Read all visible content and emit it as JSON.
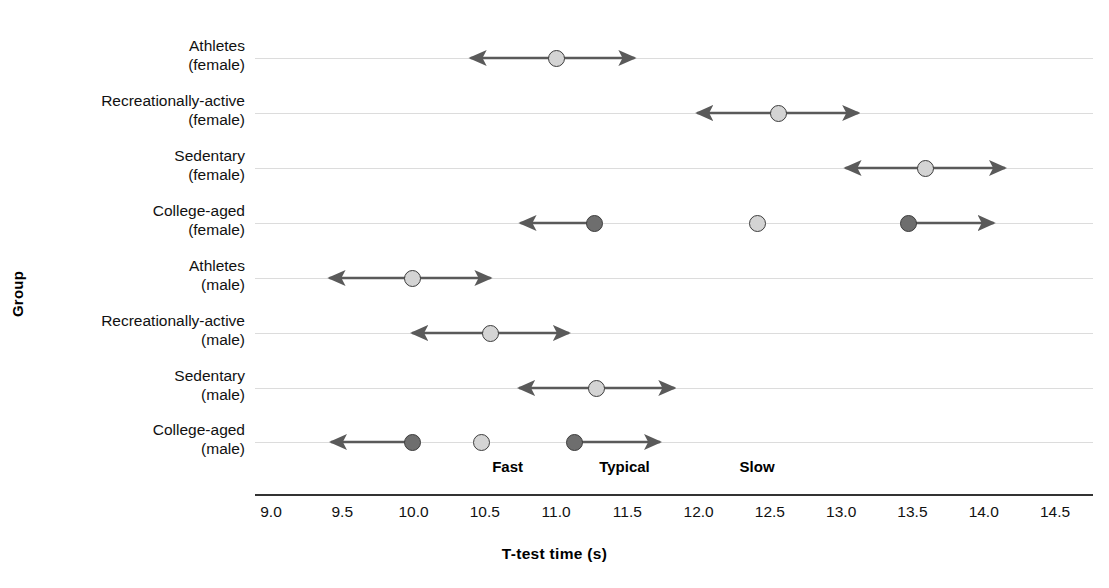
{
  "chart_data": {
    "type": "scatter",
    "title": "",
    "xlabel": "T-test time (s)",
    "ylabel": "Group",
    "xlim": [
      9.0,
      14.5
    ],
    "xticks": [
      "9.0",
      "9.5",
      "10.0",
      "10.5",
      "11.0",
      "11.5",
      "12.0",
      "12.5",
      "13.0",
      "13.5",
      "14.0",
      "14.5"
    ],
    "xtick_values": [
      9.0,
      9.5,
      10.0,
      10.5,
      11.0,
      11.5,
      12.0,
      12.5,
      13.0,
      13.5,
      14.0,
      14.5
    ],
    "grid": "horizontal",
    "legend": "none",
    "categories": [
      {
        "line1": "Athletes",
        "line2": "(female)"
      },
      {
        "line1": "Recreationally-active",
        "line2": "(female)"
      },
      {
        "line1": "Sedentary",
        "line2": "(female)"
      },
      {
        "line1": "College-aged",
        "line2": "(female)"
      },
      {
        "line1": "Athletes",
        "line2": "(male)"
      },
      {
        "line1": "Recreationally-active",
        "line2": "(male)"
      },
      {
        "line1": "Sedentary",
        "line2": "(male)"
      },
      {
        "line1": "College-aged",
        "line2": "(male)"
      }
    ],
    "annotations": [
      {
        "label": "Fast",
        "x": 10.66
      },
      {
        "label": "Typical",
        "x": 11.48
      },
      {
        "label": "Slow",
        "x": 12.41
      }
    ],
    "colors": {
      "marker_light": "#d4d4d4",
      "marker_dark": "#6e6e6e",
      "marker_edge": "#3d3d3d",
      "whisker": "#5a5a5a",
      "grid": "#dcdcdc",
      "axis": "#333333"
    },
    "rows": [
      {
        "group": "Athletes (female)",
        "points": [
          {
            "x": 11.0,
            "shade": "light",
            "left_arrow": 10.4,
            "right_arrow": 11.55
          }
        ]
      },
      {
        "group": "Recreationally-active (female)",
        "points": [
          {
            "x": 12.56,
            "shade": "light",
            "left_arrow": 11.99,
            "right_arrow": 13.12
          }
        ]
      },
      {
        "group": "Sedentary (female)",
        "points": [
          {
            "x": 13.59,
            "shade": "light",
            "left_arrow": 13.03,
            "right_arrow": 14.15
          }
        ]
      },
      {
        "group": "College-aged (female)",
        "points": [
          {
            "x": 11.27,
            "shade": "dark",
            "left_arrow": 10.75,
            "right_arrow": null
          },
          {
            "x": 12.41,
            "shade": "light",
            "left_arrow": null,
            "right_arrow": null
          },
          {
            "x": 13.47,
            "shade": "dark",
            "left_arrow": null,
            "right_arrow": 14.07
          }
        ]
      },
      {
        "group": "Athletes (male)",
        "points": [
          {
            "x": 9.99,
            "shade": "light",
            "left_arrow": 9.41,
            "right_arrow": 10.54
          }
        ]
      },
      {
        "group": "Recreationally-active (male)",
        "points": [
          {
            "x": 10.54,
            "shade": "light",
            "left_arrow": 9.99,
            "right_arrow": 11.09
          }
        ]
      },
      {
        "group": "Sedentary (male)",
        "points": [
          {
            "x": 11.28,
            "shade": "light",
            "left_arrow": 10.74,
            "right_arrow": 11.83
          }
        ]
      },
      {
        "group": "College-aged (male)",
        "points": [
          {
            "x": 9.99,
            "shade": "dark",
            "left_arrow": 9.42,
            "right_arrow": null
          },
          {
            "x": 10.48,
            "shade": "light",
            "left_arrow": null,
            "right_arrow": null
          },
          {
            "x": 11.13,
            "shade": "dark",
            "left_arrow": null,
            "right_arrow": 11.73
          }
        ]
      }
    ]
  }
}
